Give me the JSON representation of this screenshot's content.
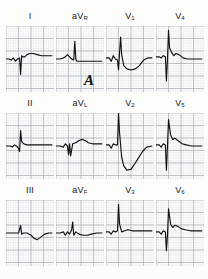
{
  "figure": {
    "kind": "12-lead-electrocardiogram",
    "panel_letter": "A",
    "background_color": "#fdfdfc",
    "grid_color": "#9aa0a6",
    "grid_minor_color": "#c9ced3",
    "trace_color": "#101010",
    "label_color": "#161616"
  },
  "rows": [
    {
      "leads": [
        {
          "name": "I",
          "sub": ""
        },
        {
          "name": "aV",
          "sub": "R"
        },
        {
          "name": "V",
          "sub": "1"
        },
        {
          "name": "V",
          "sub": "4"
        }
      ]
    },
    {
      "leads": [
        {
          "name": "II",
          "sub": ""
        },
        {
          "name": "aV",
          "sub": "L"
        },
        {
          "name": "V",
          "sub": "2"
        },
        {
          "name": "V",
          "sub": "5"
        }
      ]
    },
    {
      "leads": [
        {
          "name": "III",
          "sub": ""
        },
        {
          "name": "aV",
          "sub": "F"
        },
        {
          "name": "V",
          "sub": "3"
        },
        {
          "name": "V",
          "sub": "6"
        }
      ]
    }
  ],
  "chart_data": {
    "type": "line",
    "xlabel": "time",
    "ylabel": "voltage",
    "grid": true,
    "legend_position": "above-each-panel",
    "panel_letter": "A",
    "x_range": [
      0,
      46
    ],
    "y_range": [
      -30,
      30
    ],
    "series": [
      {
        "name": "I",
        "points": "0,0 3,0 5,-1 7,1 9,-2 11,0 13,1 14,-14 15,3 16,2 18,2 20,4 23,5 26,5 30,4 34,3 38,3 44,3"
      },
      {
        "name": "aVR",
        "points": "0,0 4,0 7,1 9,2 11,4 13,2 15,0 17,-1 18,16 19,0 20,-2 23,-2 27,-2 31,-2 36,-2 41,-2 44,-2"
      },
      {
        "name": "V1",
        "points": "0,1 3,1 5,-2 7,3 9,0 11,-1 12,-10 13,6 14,20 15,4 17,-6 20,-9 24,-10 28,-9 32,-6 36,-1 40,1 44,1"
      },
      {
        "name": "V4",
        "points": "0,2 3,2 5,1 7,3 9,2 10,-20 11,0 12,26 13,10 15,6 17,3 19,5 22,4 26,1 30,0 35,0 40,0 44,0"
      },
      {
        "name": "II",
        "points": "0,0 4,0 6,-1 8,1 10,0 12,-2 13,-5 14,14 15,4 17,2 20,1 24,1 28,1 33,1 38,1 44,1"
      },
      {
        "name": "aVL",
        "points": "0,0 4,0 7,-1 9,2 11,0 12,-8 13,2 14,-9 16,2 19,3 22,5 25,6 28,5 31,3 35,2 40,2 44,2"
      },
      {
        "name": "V2",
        "points": "0,1 3,1 5,-2 7,2 9,1 11,1 12,30 13,12 15,-10 17,-18 20,-22 24,-21 27,-17 31,-11 35,-5 39,-1 44,0"
      },
      {
        "name": "V5",
        "points": "0,1 3,1 5,-1 7,2 9,1 10,-22 11,0 12,24 14,10 16,6 18,7 21,5 25,2 29,1 34,0 39,0 44,0"
      },
      {
        "name": "III",
        "points": "0,0 5,0 9,0 12,0 14,7 15,-1 17,0 20,0 24,-2 27,-5 30,-6 33,-4 37,-1 41,0 44,0"
      },
      {
        "name": "aVF",
        "points": "0,0 4,0 7,1 9,-2 11,1 13,-1 15,3 16,10 17,-2 19,1 22,-1 26,-2 30,-2 34,-1 39,0 44,0"
      },
      {
        "name": "V3",
        "points": "0,1 3,1 5,-1 7,2 9,1 11,2 12,26 13,8 15,1 18,2 21,3 25,2 29,2 34,2 39,2 44,2"
      },
      {
        "name": "V6",
        "points": "0,1 3,1 5,-1 7,2 9,1 10,-16 11,-2 12,22 14,8 16,5 18,7 21,6 24,4 28,3 33,2 38,2 44,2"
      }
    ]
  }
}
